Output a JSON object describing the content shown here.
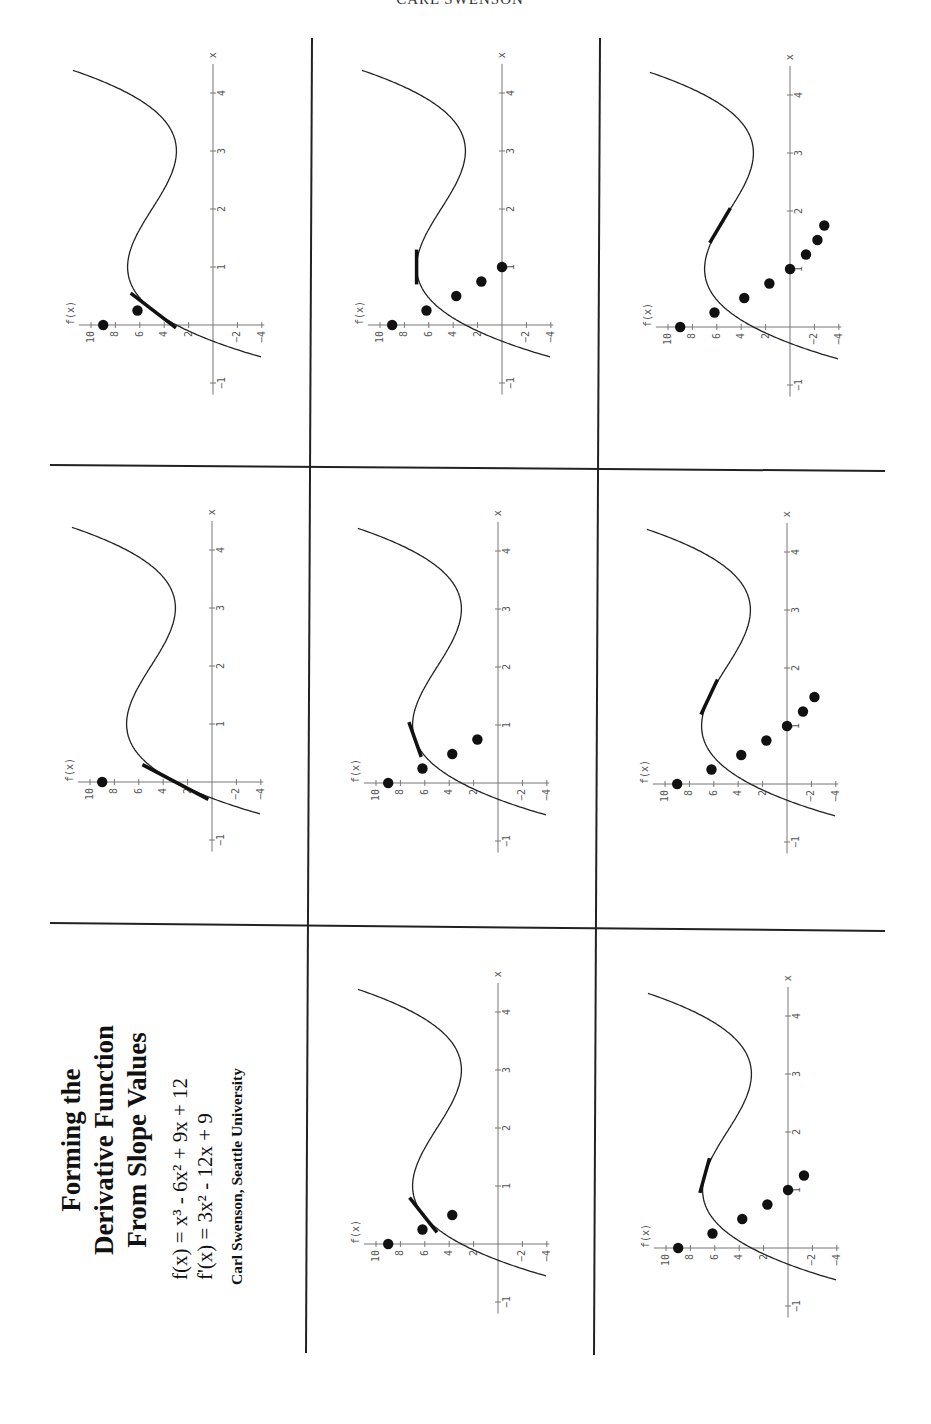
{
  "running_head": "CARL SWENSON",
  "title": {
    "lines": [
      "Forming the",
      "Derivative Function",
      "From Slope Values"
    ],
    "f_equation": "f(x) = x³ - 6x² + 9x + 12",
    "fprime_equation": "f'(x) = 3x² - 12x + 9",
    "credit": "Carl Swenson, Seattle University"
  },
  "chart_data": {
    "type": "scatter",
    "title": "Forming the Derivative Function From Slope Values",
    "orientation": "page rotated 90° counter-clockwise",
    "xlabel": "x",
    "ylabel": "f(x)",
    "x_ticks": [
      -1,
      1,
      2,
      3,
      4
    ],
    "y_ticks": [
      10,
      8,
      6,
      4,
      2,
      -2,
      -4
    ],
    "xlim": [
      -1.2,
      4.5
    ],
    "ylim": [
      -4.5,
      11
    ],
    "curve": "x^3 - 6x^2 + 9x + 3",
    "slope_points_all": {
      "x": [
        0,
        0.25,
        0.5,
        0.75,
        1,
        1.25,
        1.5,
        1.75
      ],
      "y": [
        9,
        6.19,
        3.75,
        1.69,
        0,
        -1.31,
        -2.25,
        -2.81
      ]
    },
    "panels": [
      {
        "step": 1,
        "position": "left-middle",
        "tangent_at": 0,
        "dots": 1
      },
      {
        "step": 2,
        "position": "left-top",
        "tangent_at": 0.25,
        "dots": 2
      },
      {
        "step": 3,
        "position": "middle-bottom",
        "tangent_at": 0.5,
        "dots": 3
      },
      {
        "step": 4,
        "position": "middle-middle",
        "tangent_at": 0.75,
        "dots": 4
      },
      {
        "step": 5,
        "position": "middle-top",
        "tangent_at": 1,
        "dots": 5
      },
      {
        "step": 6,
        "position": "right-bottom",
        "tangent_at": 1.25,
        "dots": 6
      },
      {
        "step": 7,
        "position": "right-middle",
        "tangent_at": 1.5,
        "dots": 7
      },
      {
        "step": 8,
        "position": "right-top",
        "tangent_at": 1.75,
        "dots": 8
      }
    ]
  },
  "axis_labels": {
    "x": "x",
    "y": "f(x)"
  }
}
